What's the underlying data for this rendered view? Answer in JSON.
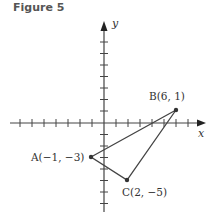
{
  "figure": {
    "title": "Figure 5",
    "axes": {
      "x_label": "x",
      "y_label": "y"
    },
    "points": [
      {
        "name": "A",
        "label": "A(−1, −3)",
        "x": -1,
        "y": -3
      },
      {
        "name": "B",
        "label": "B(6, 1)",
        "x": 6,
        "y": 1
      },
      {
        "name": "C",
        "label": "C(2, −5)",
        "x": 2,
        "y": -5
      }
    ],
    "shape": "triangle ABC",
    "colors": {
      "line": "#444444",
      "point": "#333333",
      "text": "#333333"
    }
  }
}
